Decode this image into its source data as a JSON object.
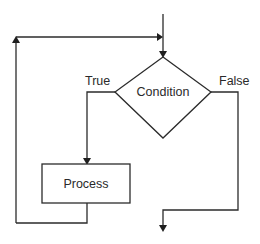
{
  "diagram": {
    "type": "flowchart",
    "nodes": {
      "condition": {
        "shape": "diamond",
        "label": "Condition"
      },
      "process": {
        "shape": "rectangle",
        "label": "Process"
      }
    },
    "edges": {
      "true_label": "True",
      "false_label": "False"
    },
    "colors": {
      "stroke": "#2b2b2b",
      "background": "#ffffff",
      "text": "#2a2a2a"
    }
  }
}
